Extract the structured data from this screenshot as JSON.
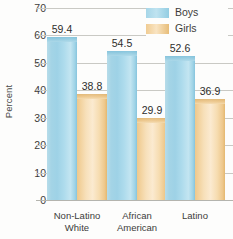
{
  "chart_data": {
    "type": "bar",
    "title": "",
    "subtitle": "",
    "xlabel": "",
    "ylabel": "Percent",
    "ylim": [
      0,
      70
    ],
    "yticks": [
      70,
      60,
      50,
      40,
      30,
      20,
      10,
      0
    ],
    "grid": true,
    "legend_position": "top-right",
    "categories": [
      "Non-Latino White",
      "African American",
      "Latino"
    ],
    "category_lines": [
      [
        "Non-Latino",
        "White"
      ],
      [
        "African",
        "American"
      ],
      [
        "Latino",
        ""
      ]
    ],
    "series": [
      {
        "name": "Boys",
        "color": "#a4d4e6",
        "values": [
          59.4,
          54.5,
          52.6
        ],
        "labels": [
          "59.4",
          "54.5",
          "52.6"
        ]
      },
      {
        "name": "Girls",
        "color": "#f2d29e",
        "values": [
          38.8,
          29.9,
          36.9
        ],
        "labels": [
          "38.8",
          "29.9",
          "36.9"
        ]
      }
    ]
  },
  "legend": {
    "items": [
      {
        "label": "Boys",
        "swatch": "boys"
      },
      {
        "label": "Girls",
        "swatch": "girls"
      }
    ]
  },
  "colors": {
    "boys": "#a4d4e6",
    "girls": "#f2d29e",
    "gridline": "#c9c9c4",
    "text": "#3c3c3a",
    "background": "#fdfdfc"
  }
}
